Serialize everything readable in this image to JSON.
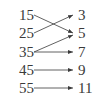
{
  "diagram": {
    "type": "mapping",
    "domain": [
      "15",
      "25",
      "35",
      "45",
      "55"
    ],
    "range": [
      "3",
      "5",
      "7",
      "9",
      "11"
    ],
    "mappings": [
      {
        "from": "15",
        "to": "5"
      },
      {
        "from": "25",
        "to": "3"
      },
      {
        "from": "35",
        "to": "5"
      },
      {
        "from": "35",
        "to": "7"
      },
      {
        "from": "45",
        "to": "9"
      },
      {
        "from": "55",
        "to": "11"
      }
    ],
    "line_color": "#3a3a3a"
  }
}
